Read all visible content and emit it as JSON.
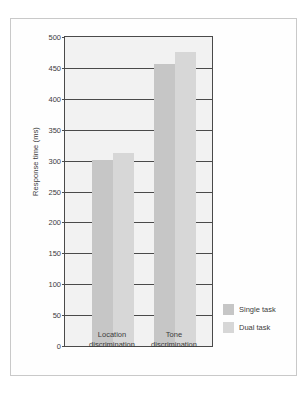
{
  "chart_data": {
    "type": "bar",
    "title": "",
    "xlabel": "",
    "ylabel": "Response time (ms)",
    "ylim": [
      0,
      500
    ],
    "ytick_labels": [
      "500",
      "450",
      "400",
      "350",
      "300",
      "250",
      "200",
      "150",
      "100",
      "50",
      "0"
    ],
    "ytick_values": [
      500,
      450,
      400,
      350,
      300,
      250,
      200,
      150,
      100,
      50,
      0
    ],
    "grid": true,
    "legend_position": "right",
    "categories": [
      "Location discrimination",
      "Tone discrimination"
    ],
    "category_lines": [
      [
        "Location",
        "discrimination"
      ],
      [
        "Tone",
        "discrimination"
      ]
    ],
    "series": [
      {
        "name": "Single task",
        "color": "#c6c6c6",
        "values": [
          301,
          456
        ]
      },
      {
        "name": "Dual task",
        "color": "#d7d7d7",
        "values": [
          312,
          475
        ]
      }
    ]
  },
  "legend": {
    "items": [
      {
        "label": "Single task"
      },
      {
        "label": "Dual task"
      }
    ]
  }
}
